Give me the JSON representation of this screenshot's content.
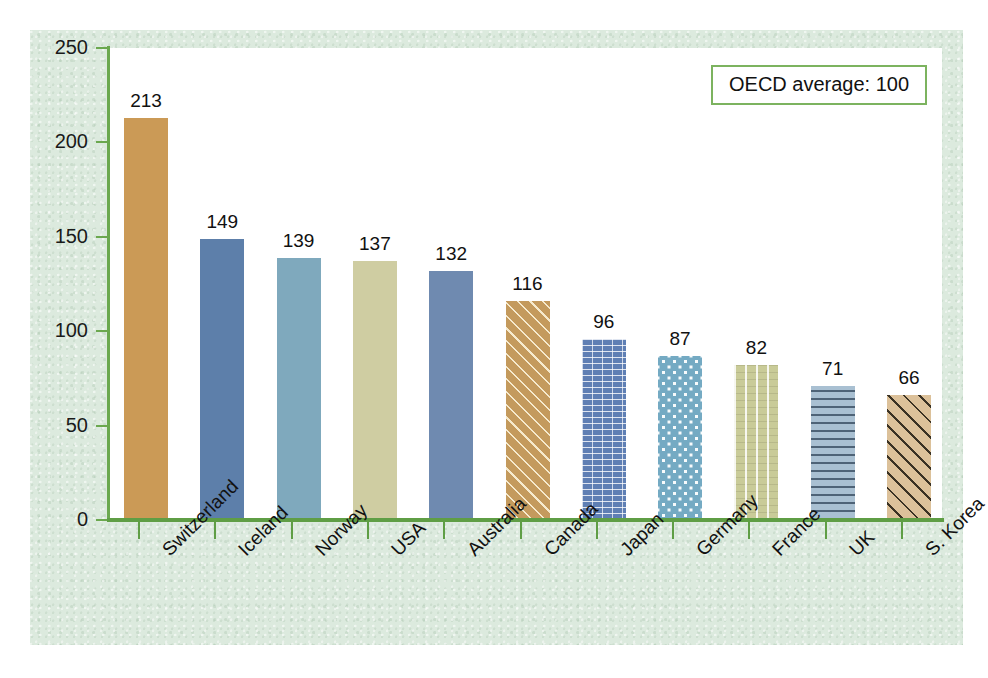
{
  "chart_data": {
    "type": "bar",
    "title": "",
    "subtitle": "",
    "xlabel": "",
    "ylabel": "",
    "ylim": [
      0,
      250
    ],
    "ytick_labels": [
      "0",
      "50",
      "100",
      "150",
      "200",
      "250"
    ],
    "ytick_values": [
      0,
      50,
      100,
      150,
      200,
      250
    ],
    "grid": false,
    "legend_position": "top-right",
    "annotations": [
      "OECD average: 100"
    ],
    "categories": [
      "Switzerland",
      "Iceland",
      "Norway",
      "USA",
      "Australia",
      "Canada",
      "Japan",
      "Germany",
      "France",
      "UK",
      "S. Korea"
    ],
    "values": [
      213,
      149,
      139,
      137,
      132,
      116,
      96,
      87,
      82,
      71,
      66
    ],
    "value_labels": [
      "213",
      "149",
      "139",
      "137",
      "132",
      "116",
      "96",
      "87",
      "82",
      "71",
      "66"
    ],
    "series": [
      {
        "name": "Index (OECD average = 100)",
        "values": [
          213,
          149,
          139,
          137,
          132,
          116,
          96,
          87,
          82,
          71,
          66
        ]
      }
    ],
    "bar_styles": [
      {
        "category": "Switzerland",
        "color": "#cb9a56",
        "pattern": "solid"
      },
      {
        "category": "Iceland",
        "color": "#5d7faa",
        "pattern": "solid"
      },
      {
        "category": "Norway",
        "color": "#7fa9bd",
        "pattern": "solid"
      },
      {
        "category": "USA",
        "color": "#cfcda2",
        "pattern": "solid"
      },
      {
        "category": "Australia",
        "color": "#6f8ab0",
        "pattern": "solid"
      },
      {
        "category": "Canada",
        "color": "#c49a5d",
        "pattern": "diagonal-light-lines"
      },
      {
        "category": "Japan",
        "color": "#5f7fb4",
        "pattern": "brick-dashes"
      },
      {
        "category": "Germany",
        "color": "#74aac3",
        "pattern": "white-dots"
      },
      {
        "category": "France",
        "color": "#c9cb98",
        "pattern": "vertical-stripes"
      },
      {
        "category": "UK",
        "color": "#a9c0d2",
        "pattern": "horizontal-dashes"
      },
      {
        "category": "S. Korea",
        "color": "#dcc19a",
        "pattern": "diagonal-dark-dots"
      }
    ]
  },
  "legend": {
    "text": "OECD average: 100"
  },
  "colors": {
    "panel_background": "#dceade",
    "plot_background": "#ffffff",
    "axis": "#5f9e45",
    "axis_tick": "#6ba84f",
    "legend_border": "#7cb35f",
    "text": "#111111"
  }
}
